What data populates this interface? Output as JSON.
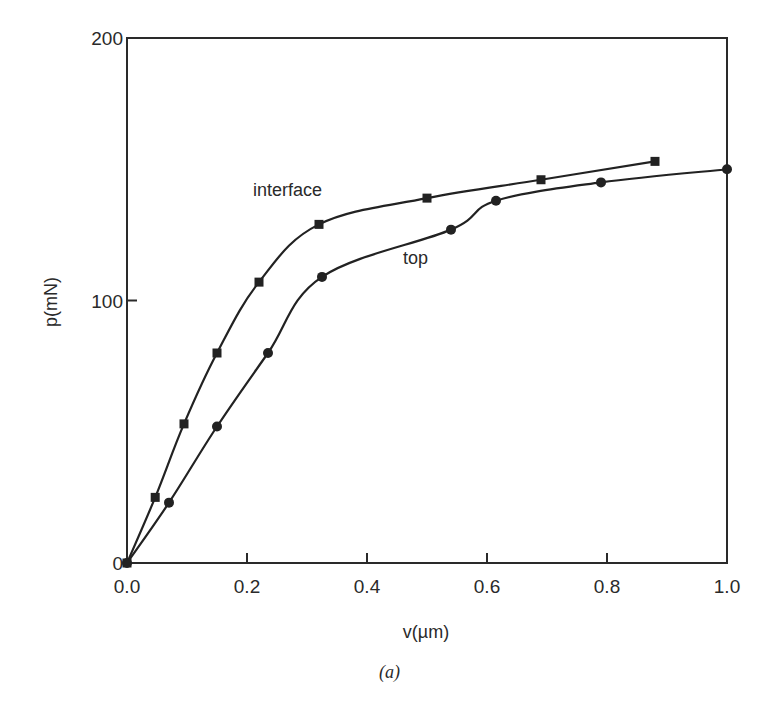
{
  "chart_data": {
    "type": "line",
    "title": "",
    "caption": "(a)",
    "xlabel": "v(µm)",
    "ylabel": "p(mN)",
    "xlim": [
      0.0,
      1.0
    ],
    "ylim": [
      0,
      200
    ],
    "x_ticks": [
      "0.0",
      "0.2",
      "0.4",
      "0.6",
      "0.8",
      "1.0"
    ],
    "y_ticks": [
      "0",
      "100",
      "200"
    ],
    "grid": false,
    "legend": "inline labels",
    "series": [
      {
        "name": "interface",
        "marker": "square",
        "color": "#222222",
        "points": [
          [
            0.0,
            0
          ],
          [
            0.047,
            25
          ],
          [
            0.095,
            53
          ],
          [
            0.15,
            80
          ],
          [
            0.22,
            107
          ],
          [
            0.32,
            129
          ],
          [
            0.5,
            139
          ],
          [
            0.69,
            146
          ],
          [
            0.88,
            153
          ]
        ]
      },
      {
        "name": "top",
        "marker": "circle",
        "color": "#222222",
        "points": [
          [
            0.0,
            0
          ],
          [
            0.07,
            23
          ],
          [
            0.15,
            52
          ],
          [
            0.235,
            80
          ],
          [
            0.325,
            109
          ],
          [
            0.54,
            127
          ],
          [
            0.615,
            138
          ],
          [
            0.79,
            145
          ],
          [
            1.0,
            150
          ]
        ]
      }
    ],
    "annotations": [
      {
        "text": "interface",
        "x": 0.21,
        "y": 140
      },
      {
        "text": "top",
        "x": 0.46,
        "y": 114
      }
    ]
  }
}
